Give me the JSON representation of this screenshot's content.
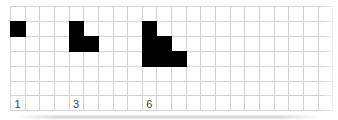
{
  "figure": {
    "background": "#ffffff",
    "grid": {
      "columns": 22,
      "rows": 7,
      "line_color": "#d2d2d2",
      "filled_cell_color": "#000000"
    },
    "patterns": [
      {
        "label": "1",
        "start_col": 0,
        "start_row": 1,
        "cells": [
          [
            0,
            0
          ]
        ]
      },
      {
        "label": "3",
        "start_col": 4,
        "start_row": 1,
        "cells": [
          [
            0,
            0
          ],
          [
            0,
            1
          ],
          [
            1,
            1
          ]
        ]
      },
      {
        "label": "6",
        "start_col": 9,
        "start_row": 1,
        "cells": [
          [
            0,
            0
          ],
          [
            0,
            1
          ],
          [
            1,
            1
          ],
          [
            0,
            2
          ],
          [
            1,
            2
          ],
          [
            2,
            2
          ]
        ]
      }
    ],
    "labels": {
      "row": 6,
      "color": "#424242",
      "font_size": 11
    }
  }
}
